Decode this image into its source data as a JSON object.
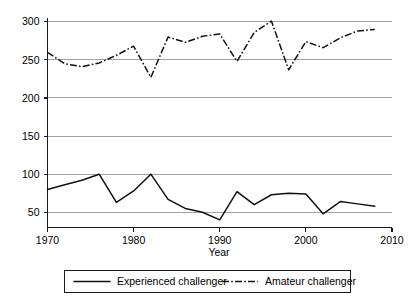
{
  "chart_data": {
    "type": "line",
    "title": "",
    "xlabel": "Year",
    "ylabel": "",
    "xlim": [
      1970,
      2010
    ],
    "ylim": [
      30,
      305
    ],
    "grid": true,
    "legend_position": "bottom",
    "xticks": [
      1970,
      1980,
      1990,
      2000,
      2010
    ],
    "yticks": [
      50,
      100,
      150,
      200,
      250,
      300
    ],
    "x": [
      1970,
      1972,
      1974,
      1976,
      1978,
      1980,
      1982,
      1984,
      1986,
      1988,
      1990,
      1992,
      1994,
      1996,
      1998,
      2000,
      2002,
      2004,
      2006,
      2008
    ],
    "series": [
      {
        "name": "Experienced challenger",
        "style": "solid",
        "values": [
          80,
          86,
          92,
          100,
          63,
          78,
          100,
          67,
          55,
          50,
          40,
          77,
          60,
          73,
          75,
          74,
          48,
          64,
          61,
          58
        ]
      },
      {
        "name": "Amateur challenger",
        "style": "dash-dot",
        "values": [
          260,
          245,
          241,
          246,
          256,
          268,
          227,
          280,
          273,
          281,
          284,
          248,
          286,
          301,
          237,
          274,
          266,
          279,
          288,
          290
        ]
      }
    ]
  },
  "axes": {
    "x_tick_labels": [
      "1970",
      "1980",
      "1990",
      "2000",
      "2010"
    ],
    "y_tick_labels": [
      "50",
      "100",
      "150",
      "200",
      "250",
      "300"
    ],
    "x_axis_title": "Year"
  },
  "legend": {
    "entries": [
      {
        "label": "Experienced challenger",
        "style": "solid"
      },
      {
        "label": "Amateur challenger",
        "style": "dash-dot"
      }
    ]
  },
  "colors": {
    "line": "#111111",
    "grid": "#8a8a8a",
    "axis": "#1a1a1a",
    "background": "#ffffff"
  }
}
